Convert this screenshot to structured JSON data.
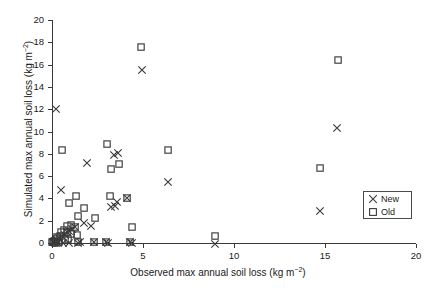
{
  "chart_data": {
    "type": "scatter",
    "title": "",
    "xlabel": "Observed max annual soil loss (kg m-2)",
    "xlabel_main": "Observed max annual soil loss (kg m",
    "xlabel_sup": "−2",
    "xlabel_tail": ")",
    "ylabel_main": "Simulated max annual soil loss (kg m",
    "ylabel_sup": "−2",
    "ylabel_tail": ")",
    "xlim": [
      0,
      20
    ],
    "ylim": [
      0,
      20
    ],
    "xticks": [
      0,
      5,
      10,
      15,
      20
    ],
    "yticks": [
      0,
      2,
      4,
      6,
      8,
      10,
      12,
      14,
      16,
      18,
      20
    ],
    "xticklabels": [
      "0",
      "5",
      "10",
      "15",
      "20"
    ],
    "yticklabels": [
      "0",
      "2",
      "4",
      "6",
      "8",
      "10",
      "12",
      "14",
      "16",
      "18",
      "20"
    ],
    "grid": false,
    "legend_position": "lower right",
    "series": [
      {
        "name": "New",
        "marker": "x",
        "color": "#3a3a3a",
        "points": [
          [
            0.2,
            12.05
          ],
          [
            0.5,
            4.75
          ],
          [
            1.95,
            7.2
          ],
          [
            3.4,
            7.85
          ],
          [
            3.65,
            8.05
          ],
          [
            3.25,
            3.25
          ],
          [
            3.45,
            3.35
          ],
          [
            4.1,
            4.0
          ],
          [
            3.55,
            3.65
          ],
          [
            4.95,
            15.55
          ],
          [
            6.35,
            5.45
          ],
          [
            14.7,
            2.85
          ],
          [
            15.65,
            10.3
          ],
          [
            1.75,
            1.8
          ],
          [
            2.15,
            1.55
          ],
          [
            1.25,
            1.4
          ],
          [
            1.1,
            1.25
          ],
          [
            0.95,
            1.1
          ],
          [
            0.85,
            0.95
          ],
          [
            0.7,
            0.75
          ],
          [
            0.55,
            0.6
          ],
          [
            0.4,
            0.45
          ],
          [
            0.28,
            0.3
          ],
          [
            0.18,
            0.2
          ],
          [
            0.1,
            0.12
          ],
          [
            0.05,
            0.05
          ],
          [
            0.95,
            0.0
          ],
          [
            1.45,
            0.0
          ],
          [
            1.55,
            0.05
          ],
          [
            2.3,
            0.05
          ],
          [
            2.95,
            0.05
          ],
          [
            3.05,
            0.0
          ],
          [
            4.3,
            0.05
          ],
          [
            4.4,
            0.0
          ],
          [
            8.95,
            -0.1
          ],
          [
            0.6,
            0.0
          ],
          [
            0.35,
            0.0
          ]
        ]
      },
      {
        "name": "Old",
        "marker": "s",
        "color": "#3a3a3a",
        "points": [
          [
            0.55,
            8.3
          ],
          [
            4.9,
            17.55
          ],
          [
            3.0,
            8.85
          ],
          [
            3.25,
            6.6
          ],
          [
            3.7,
            7.1
          ],
          [
            6.35,
            8.35
          ],
          [
            14.75,
            6.7
          ],
          [
            15.7,
            16.4
          ],
          [
            1.3,
            4.2
          ],
          [
            3.2,
            4.2
          ],
          [
            4.1,
            4.0
          ],
          [
            0.95,
            3.55
          ],
          [
            1.75,
            3.1
          ],
          [
            1.45,
            2.45
          ],
          [
            2.35,
            2.25
          ],
          [
            4.4,
            1.4
          ],
          [
            1.05,
            1.65
          ],
          [
            0.85,
            1.55
          ],
          [
            1.25,
            1.45
          ],
          [
            1.35,
            0.7
          ],
          [
            1.05,
            0.85
          ],
          [
            0.8,
            0.95
          ],
          [
            0.65,
            1.15
          ],
          [
            0.5,
            0.95
          ],
          [
            0.45,
            0.6
          ],
          [
            0.3,
            0.55
          ],
          [
            0.22,
            0.35
          ],
          [
            0.12,
            0.22
          ],
          [
            0.06,
            0.12
          ],
          [
            0.02,
            0.05
          ],
          [
            0.7,
            0.25
          ],
          [
            0.9,
            0.4
          ],
          [
            1.45,
            0.05
          ],
          [
            2.3,
            0.05
          ],
          [
            2.95,
            0.05
          ],
          [
            4.3,
            0.05
          ],
          [
            8.95,
            0.6
          ],
          [
            0.38,
            0.08
          ],
          [
            0.18,
            0.02
          ]
        ]
      }
    ],
    "legend": [
      {
        "label": "New",
        "marker": "x"
      },
      {
        "label": "Old",
        "marker": "s"
      }
    ]
  }
}
